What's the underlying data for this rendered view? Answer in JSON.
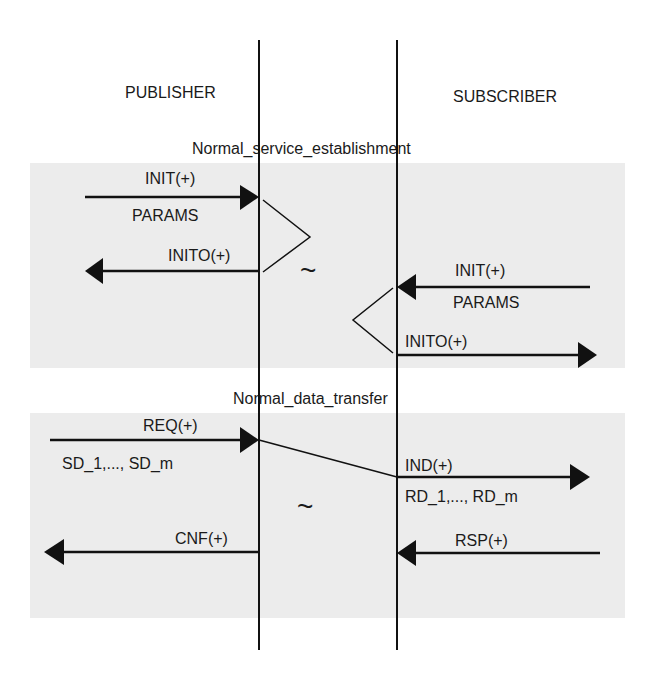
{
  "participants": {
    "left": "PUBLISHER",
    "right": "SUBSCRIBER"
  },
  "sections": [
    {
      "title": "Normal_service_establishment",
      "messages": {
        "pub_in": {
          "label": "INIT(+)",
          "param": "PARAMS"
        },
        "pub_out": {
          "label": "INITO(+)"
        },
        "sub_in": {
          "label": "INIT(+)",
          "param": "PARAMS"
        },
        "sub_out": {
          "label": "INITO(+)"
        }
      },
      "gap_symbol": "~"
    },
    {
      "title": "Normal_data_transfer",
      "messages": {
        "req": {
          "label": "REQ(+)",
          "param": "SD_1,..., SD_m"
        },
        "ind": {
          "label": "IND(+)",
          "param": "RD_1,..., RD_m"
        },
        "cnf": {
          "label": "CNF(+)"
        },
        "rsp": {
          "label": "RSP(+)"
        }
      },
      "gap_symbol": "~"
    }
  ],
  "colors": {
    "section_bg": "#ececec",
    "line": "#111111"
  }
}
